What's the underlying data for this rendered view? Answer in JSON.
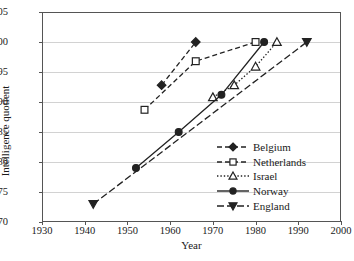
{
  "chart_data": {
    "type": "line",
    "title": "",
    "xlabel": "Year",
    "ylabel": "Intelligence quotient",
    "xlim": [
      1930,
      2000
    ],
    "ylim": [
      70,
      105
    ],
    "xticks": [
      1930,
      1940,
      1950,
      1960,
      1970,
      1980,
      1990,
      2000
    ],
    "yticks": [
      70,
      75,
      80,
      85,
      90,
      95,
      100,
      105
    ],
    "grid": "horizontal",
    "legend_position": "lower right",
    "series": [
      {
        "name": "Belgium",
        "marker": "diamond",
        "linestyle": "dashed",
        "color": "#222222",
        "x": [
          1958,
          1966
        ],
        "y": [
          92.8,
          100.0
        ]
      },
      {
        "name": "Netherlands",
        "marker": "square",
        "linestyle": "dashed",
        "color": "#222222",
        "x": [
          1954,
          1966,
          1980
        ],
        "y": [
          88.7,
          96.8,
          100.0
        ]
      },
      {
        "name": "Israel",
        "marker": "triangle-up",
        "linestyle": "dotted",
        "color": "#222222",
        "x": [
          1970,
          1975,
          1980,
          1985
        ],
        "y": [
          90.8,
          92.8,
          95.9,
          100.0
        ]
      },
      {
        "name": "Norway",
        "marker": "circle",
        "linestyle": "solid",
        "color": "#222222",
        "x": [
          1952,
          1962,
          1972,
          1982
        ],
        "y": [
          79.0,
          85.0,
          91.2,
          100.0
        ]
      },
      {
        "name": "England",
        "marker": "triangle-down",
        "linestyle": "dashdot",
        "color": "#222222",
        "x": [
          1942,
          1992
        ],
        "y": [
          73.0,
          100.0
        ]
      }
    ]
  },
  "axes": {
    "ylabel_text": "Intelligence quotient",
    "xlabel_text": "Year",
    "ytick_labels": [
      "70",
      "75",
      "80",
      "85",
      "90",
      "95",
      "100",
      "105"
    ],
    "xtick_labels": [
      "1930",
      "1940",
      "1950",
      "1960",
      "1970",
      "1980",
      "1990",
      "2000"
    ]
  },
  "legend": {
    "entries": [
      {
        "label": "Belgium"
      },
      {
        "label": "Netherlands"
      },
      {
        "label": "Israel"
      },
      {
        "label": "Norway"
      },
      {
        "label": "England"
      }
    ]
  }
}
